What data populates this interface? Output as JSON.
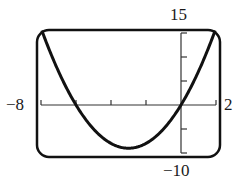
{
  "chart_data": {
    "type": "line",
    "title": "",
    "xlabel": "",
    "ylabel": "",
    "xlim": [
      -8,
      2
    ],
    "ylim": [
      -10,
      15
    ],
    "x_tick_step": 2,
    "y_tick_step": 5,
    "grid": false,
    "series": [
      {
        "name": "y = x^2 + 6x",
        "x": [
          -8,
          -7,
          -6,
          -5,
          -4,
          -3,
          -2,
          -1,
          0,
          1,
          2
        ],
        "y": [
          16,
          7,
          0,
          -5,
          -8,
          -9,
          -8,
          -5,
          0,
          7,
          16
        ]
      }
    ],
    "labels": {
      "xmin": "−8",
      "xmax": "2",
      "ymax": "15",
      "ymin": "−10"
    }
  }
}
